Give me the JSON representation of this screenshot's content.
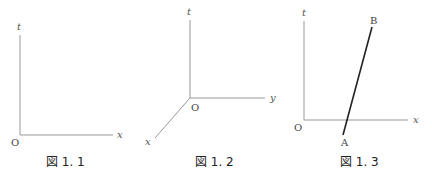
{
  "figures": [
    {
      "caption": "図 1. 1",
      "labels": {
        "t": "t",
        "x": "x",
        "origin": "O"
      }
    },
    {
      "caption": "図 1. 2",
      "labels": {
        "t": "t",
        "x": "x",
        "y": "y",
        "origin": "O"
      }
    },
    {
      "caption": "図 1. 3",
      "labels": {
        "t": "t",
        "x": "x",
        "origin": "O",
        "point_a": "A",
        "point_b": "B"
      }
    }
  ],
  "colors": {
    "axis": "#999999",
    "worldline": "#222222",
    "text": "#444444"
  }
}
